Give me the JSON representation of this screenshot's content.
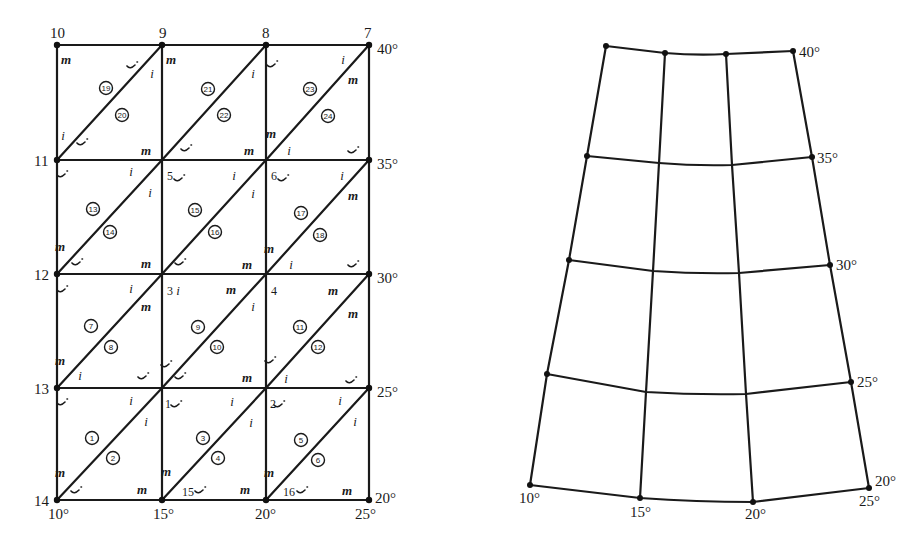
{
  "left_mesh": {
    "columns_x": [
      57,
      162,
      266,
      369
    ],
    "rows_y": [
      45,
      160,
      274,
      388,
      500
    ],
    "node_labels": [
      {
        "text": "10",
        "x": 50,
        "y": 38,
        "anchor": "start"
      },
      {
        "text": "9",
        "x": 159,
        "y": 38,
        "anchor": "start"
      },
      {
        "text": "8",
        "x": 262,
        "y": 38,
        "anchor": "start"
      },
      {
        "text": "7",
        "x": 364,
        "y": 38,
        "anchor": "start"
      },
      {
        "text": "11",
        "x": 34,
        "y": 166,
        "anchor": "start"
      },
      {
        "text": "12",
        "x": 34,
        "y": 280,
        "anchor": "start"
      },
      {
        "text": "13",
        "x": 34,
        "y": 394,
        "anchor": "start"
      },
      {
        "text": "14",
        "x": 34,
        "y": 506,
        "anchor": "start"
      }
    ],
    "inner_node_labels": [
      {
        "text": "5",
        "x": 167,
        "y": 180
      },
      {
        "text": "6",
        "x": 271,
        "y": 180
      },
      {
        "text": "3",
        "x": 167,
        "y": 295
      },
      {
        "text": "4",
        "x": 271,
        "y": 295
      },
      {
        "text": "1",
        "x": 165,
        "y": 408
      },
      {
        "text": "2",
        "x": 270,
        "y": 408
      },
      {
        "text": "15",
        "x": 182,
        "y": 496
      },
      {
        "text": "16",
        "x": 283,
        "y": 496
      }
    ],
    "right_degree_labels": [
      {
        "text": "40°",
        "x": 377,
        "y": 54
      },
      {
        "text": "35°",
        "x": 377,
        "y": 169
      },
      {
        "text": "30°",
        "x": 377,
        "y": 283
      },
      {
        "text": "25°",
        "x": 377,
        "y": 397
      },
      {
        "text": "20°",
        "x": 375,
        "y": 503
      }
    ],
    "bottom_degree_labels": [
      {
        "text": "10°",
        "x": 48,
        "y": 519
      },
      {
        "text": "15°",
        "x": 153,
        "y": 519
      },
      {
        "text": "20°",
        "x": 255,
        "y": 519
      },
      {
        "text": "25°",
        "x": 355,
        "y": 519
      }
    ],
    "elements": [
      {
        "num": "19",
        "x": 106,
        "y": 88
      },
      {
        "num": "20",
        "x": 122,
        "y": 115
      },
      {
        "num": "21",
        "x": 208,
        "y": 89
      },
      {
        "num": "22",
        "x": 224,
        "y": 115
      },
      {
        "num": "23",
        "x": 310,
        "y": 89
      },
      {
        "num": "24",
        "x": 328,
        "y": 116
      },
      {
        "num": "13",
        "x": 93,
        "y": 209
      },
      {
        "num": "14",
        "x": 110,
        "y": 232
      },
      {
        "num": "15",
        "x": 195,
        "y": 210
      },
      {
        "num": "16",
        "x": 215,
        "y": 232
      },
      {
        "num": "17",
        "x": 301,
        "y": 213
      },
      {
        "num": "18",
        "x": 320,
        "y": 235
      },
      {
        "num": "7",
        "x": 91,
        "y": 326
      },
      {
        "num": "8",
        "x": 111,
        "y": 347
      },
      {
        "num": "9",
        "x": 198,
        "y": 327
      },
      {
        "num": "10",
        "x": 217,
        "y": 347
      },
      {
        "num": "11",
        "x": 300,
        "y": 327
      },
      {
        "num": "12",
        "x": 318,
        "y": 347
      },
      {
        "num": "1",
        "x": 92,
        "y": 438
      },
      {
        "num": "2",
        "x": 113,
        "y": 458
      },
      {
        "num": "3",
        "x": 203,
        "y": 438
      },
      {
        "num": "4",
        "x": 218,
        "y": 458
      },
      {
        "num": "5",
        "x": 301,
        "y": 440
      },
      {
        "num": "6",
        "x": 318,
        "y": 460
      }
    ],
    "corner_marks": [
      {
        "t": "m",
        "x": 66,
        "y": 64
      },
      {
        "t": "j",
        "x": 132,
        "y": 67
      },
      {
        "t": "i",
        "x": 152,
        "y": 78
      },
      {
        "t": "i",
        "x": 63,
        "y": 140
      },
      {
        "t": "j",
        "x": 82,
        "y": 144
      },
      {
        "t": "m",
        "x": 146,
        "y": 155
      },
      {
        "t": "m",
        "x": 171,
        "y": 64
      },
      {
        "t": "i",
        "x": 253,
        "y": 78
      },
      {
        "t": "j",
        "x": 186,
        "y": 150
      },
      {
        "t": "m",
        "x": 249,
        "y": 155
      },
      {
        "t": "j",
        "x": 272,
        "y": 66
      },
      {
        "t": "i",
        "x": 343,
        "y": 64
      },
      {
        "t": "m",
        "x": 353,
        "y": 84
      },
      {
        "t": "m",
        "x": 271,
        "y": 138
      },
      {
        "t": "i",
        "x": 289,
        "y": 155
      },
      {
        "t": "j",
        "x": 353,
        "y": 152
      },
      {
        "t": "j",
        "x": 62,
        "y": 176
      },
      {
        "t": "i",
        "x": 131,
        "y": 176
      },
      {
        "t": "i",
        "x": 150,
        "y": 197
      },
      {
        "t": "m",
        "x": 60,
        "y": 251
      },
      {
        "t": "j",
        "x": 77,
        "y": 264
      },
      {
        "t": "m",
        "x": 146,
        "y": 268
      },
      {
        "t": "j",
        "x": 179,
        "y": 180
      },
      {
        "t": "i",
        "x": 234,
        "y": 180
      },
      {
        "t": "i",
        "x": 253,
        "y": 198
      },
      {
        "t": "j",
        "x": 180,
        "y": 264
      },
      {
        "t": "m",
        "x": 247,
        "y": 269
      },
      {
        "t": "j",
        "x": 283,
        "y": 180
      },
      {
        "t": "i",
        "x": 342,
        "y": 180
      },
      {
        "t": "m",
        "x": 353,
        "y": 200
      },
      {
        "t": "m",
        "x": 269,
        "y": 253
      },
      {
        "t": "i",
        "x": 291,
        "y": 269
      },
      {
        "t": "j",
        "x": 353,
        "y": 266
      },
      {
        "t": "j",
        "x": 62,
        "y": 291
      },
      {
        "t": "i",
        "x": 131,
        "y": 293
      },
      {
        "t": "m",
        "x": 146,
        "y": 311
      },
      {
        "t": "m",
        "x": 60,
        "y": 365
      },
      {
        "t": "i",
        "x": 80,
        "y": 380
      },
      {
        "t": "j",
        "x": 143,
        "y": 378
      },
      {
        "t": "i",
        "x": 178,
        "y": 295
      },
      {
        "t": "m",
        "x": 231,
        "y": 294
      },
      {
        "t": "i",
        "x": 253,
        "y": 311
      },
      {
        "t": "j",
        "x": 166,
        "y": 366
      },
      {
        "t": "j",
        "x": 180,
        "y": 378
      },
      {
        "t": "m",
        "x": 247,
        "y": 382
      },
      {
        "t": "m",
        "x": 333,
        "y": 295
      },
      {
        "t": "m",
        "x": 353,
        "y": 318
      },
      {
        "t": "j",
        "x": 270,
        "y": 362
      },
      {
        "t": "i",
        "x": 286,
        "y": 383
      },
      {
        "t": "j",
        "x": 351,
        "y": 382
      },
      {
        "t": "j",
        "x": 62,
        "y": 404
      },
      {
        "t": "i",
        "x": 131,
        "y": 405
      },
      {
        "t": "i",
        "x": 146,
        "y": 426
      },
      {
        "t": "m",
        "x": 60,
        "y": 477
      },
      {
        "t": "j",
        "x": 76,
        "y": 492
      },
      {
        "t": "m",
        "x": 142,
        "y": 494
      },
      {
        "t": "j",
        "x": 176,
        "y": 406
      },
      {
        "t": "i",
        "x": 232,
        "y": 406
      },
      {
        "t": "i",
        "x": 251,
        "y": 427
      },
      {
        "t": "m",
        "x": 166,
        "y": 476
      },
      {
        "t": "j",
        "x": 200,
        "y": 492
      },
      {
        "t": "m",
        "x": 245,
        "y": 494
      },
      {
        "t": "j",
        "x": 279,
        "y": 406
      },
      {
        "t": "i",
        "x": 340,
        "y": 405
      },
      {
        "t": "i",
        "x": 355,
        "y": 426
      },
      {
        "t": "m",
        "x": 269,
        "y": 477
      },
      {
        "t": "j",
        "x": 302,
        "y": 492
      },
      {
        "t": "m",
        "x": 347,
        "y": 495
      }
    ]
  },
  "right_projection": {
    "rows": [
      [
        [
          606,
          46
        ],
        [
          665,
          53
        ],
        [
          726,
          54
        ],
        [
          793,
          51
        ]
      ],
      [
        [
          587,
          156
        ],
        [
          659,
          163
        ],
        [
          732,
          165
        ],
        [
          812,
          157
        ]
      ],
      [
        [
          569,
          260
        ],
        [
          653,
          271
        ],
        [
          739,
          273
        ],
        [
          830,
          265
        ]
      ],
      [
        [
          547,
          374
        ],
        [
          646,
          392
        ],
        [
          746,
          394
        ],
        [
          851,
          382
        ]
      ],
      [
        [
          530,
          485
        ],
        [
          640,
          498
        ],
        [
          753,
          502
        ],
        [
          869,
          488
        ]
      ]
    ],
    "latitude_labels": [
      {
        "text": "40°",
        "x": 799,
        "y": 57
      },
      {
        "text": "35°",
        "x": 817,
        "y": 163
      },
      {
        "text": "30°",
        "x": 836,
        "y": 270
      },
      {
        "text": "25°",
        "x": 857,
        "y": 387
      },
      {
        "text": "20°",
        "x": 875,
        "y": 486
      }
    ],
    "longitude_labels": [
      {
        "text": "10°",
        "x": 519,
        "y": 503
      },
      {
        "text": "15°",
        "x": 630,
        "y": 517
      },
      {
        "text": "20°",
        "x": 745,
        "y": 519
      },
      {
        "text": "25°",
        "x": 859,
        "y": 506
      }
    ]
  }
}
